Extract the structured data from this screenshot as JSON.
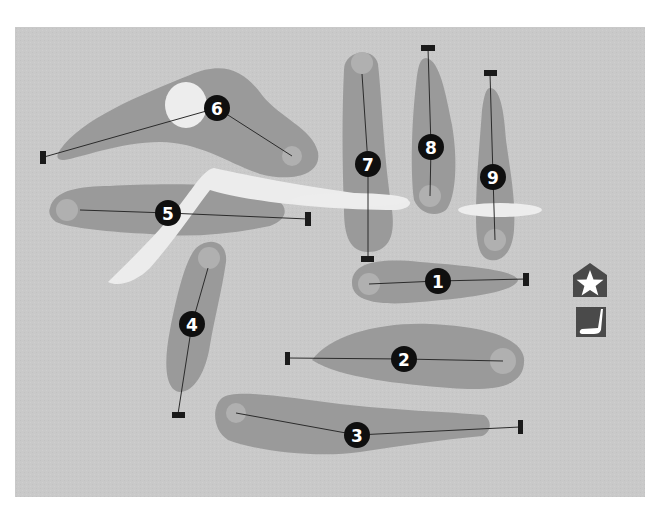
{
  "map": {
    "title": "Golf course layout",
    "frame": {
      "x": 15,
      "y": 27,
      "width": 630,
      "height": 470
    },
    "colors": {
      "background": "#ffffff",
      "rough": "#c9c9c9",
      "fairway": "#9a9a9a",
      "green": "#b0b0b0",
      "bunker": "#ededed",
      "path": "#ececec",
      "line": "#2b2b2b",
      "tee": "#1a1a1a",
      "marker": "#0f0f0f",
      "marker_text": "#ffffff",
      "icon_bg": "#4a4a4a",
      "icon_fg": "#ffffff"
    }
  },
  "holes": [
    {
      "number": "1",
      "label": "Hole 1",
      "fairway": "M352,283 C352,262 380,258 420,262 C470,266 515,270 518,280 C515,292 470,298 420,302 C380,306 352,302 352,283 Z",
      "green": {
        "cx": 369,
        "cy": 284,
        "r": 11
      },
      "tee": {
        "x": 523,
        "y": 273,
        "w": 6,
        "h": 13
      },
      "line": [
        [
          369,
          284
        ],
        [
          438,
          281
        ],
        [
          526,
          279
        ]
      ],
      "marker": {
        "cx": 438,
        "cy": 281
      }
    },
    {
      "number": "2",
      "label": "Hole 2",
      "fairway": "M312,360 C330,335 380,322 430,324 C480,326 520,336 524,358 C526,385 500,392 450,388 C400,384 340,378 312,360 Z",
      "green": {
        "cx": 503,
        "cy": 361,
        "r": 13
      },
      "tee": {
        "x": 285,
        "y": 352,
        "w": 5,
        "h": 13
      },
      "line": [
        [
          288,
          358
        ],
        [
          404,
          359
        ],
        [
          503,
          361
        ]
      ],
      "marker": {
        "cx": 404,
        "cy": 359
      }
    },
    {
      "number": "3",
      "label": "Hole 3",
      "fairway": "M222,398 C235,388 290,398 340,404 C390,410 450,412 484,415 C492,420 492,432 482,436 C440,440 400,446 360,452 C320,458 260,452 228,440 C212,430 212,406 222,398 Z",
      "green": {
        "cx": 236,
        "cy": 413,
        "r": 10
      },
      "tee": {
        "x": 518,
        "y": 420,
        "w": 5,
        "h": 14
      },
      "line": [
        [
          236,
          413
        ],
        [
          357,
          435
        ],
        [
          520,
          427
        ]
      ],
      "marker": {
        "cx": 357,
        "cy": 435
      }
    },
    {
      "number": "4",
      "label": "Hole 4",
      "fairway": "M196,248 C210,236 228,242 226,262 C222,290 214,320 210,345 C206,372 194,392 180,392 C164,390 164,360 170,330 C176,300 184,262 196,248 Z",
      "green": {
        "cx": 209,
        "cy": 258,
        "r": 11
      },
      "tee": {
        "x": 172,
        "y": 412,
        "w": 13,
        "h": 6
      },
      "line": [
        [
          208,
          268
        ],
        [
          192,
          324
        ],
        [
          178,
          414
        ]
      ],
      "marker": {
        "cx": 192,
        "cy": 324
      }
    },
    {
      "number": "5",
      "label": "Hole 5",
      "fairway": "M50,208 C54,190 80,186 110,186 C150,184 220,182 260,192 C290,200 292,218 270,226 C230,234 190,238 150,234 C110,232 70,228 56,222 C50,218 48,212 50,208 Z",
      "green": {
        "cx": 67,
        "cy": 210,
        "r": 11
      },
      "tee": {
        "x": 305,
        "y": 212,
        "w": 6,
        "h": 14
      },
      "line": [
        [
          80,
          210
        ],
        [
          168,
          213
        ],
        [
          308,
          219
        ]
      ],
      "marker": {
        "cx": 168,
        "cy": 213
      }
    },
    {
      "number": "6",
      "label": "Hole 6",
      "fairway": "M60,150 C80,120 140,95 190,75 C225,60 245,72 262,95 C280,118 312,128 318,152 C322,176 290,182 260,174 C230,164 200,142 160,142 C120,142 80,158 64,160 C56,160 56,156 60,150 Z",
      "green": {
        "cx": 292,
        "cy": 156,
        "r": 10
      },
      "bunker": {
        "cx": 186,
        "cy": 105,
        "rx": 21,
        "ry": 23
      },
      "tee": {
        "x": 40,
        "y": 151,
        "w": 6,
        "h": 13
      },
      "line": [
        [
          44,
          157
        ],
        [
          217,
          108
        ],
        [
          292,
          156
        ]
      ],
      "marker": {
        "cx": 217,
        "cy": 108
      }
    },
    {
      "number": "7",
      "label": "Hole 7",
      "fairway": "M344,70 C344,50 374,46 378,64 C382,100 384,160 392,210 C396,240 386,252 368,252 C350,252 344,236 344,210 C342,160 342,110 344,70 Z",
      "green": {
        "cx": 362,
        "cy": 63,
        "r": 11
      },
      "tee": {
        "x": 361,
        "y": 256,
        "w": 13,
        "h": 6
      },
      "line": [
        [
          362,
          74
        ],
        [
          368,
          164
        ],
        [
          368,
          259
        ]
      ],
      "marker": {
        "cx": 368,
        "cy": 164
      }
    },
    {
      "number": "8",
      "label": "Hole 8",
      "fairway": "M426,58 C440,60 446,95 452,125 C458,160 456,198 446,210 C436,218 420,214 414,200 C410,170 412,120 416,84 C418,66 420,58 426,58 Z",
      "green": {
        "cx": 430,
        "cy": 196,
        "r": 11
      },
      "tee": {
        "x": 421,
        "y": 45,
        "w": 14,
        "h": 6
      },
      "line": [
        [
          428,
          48
        ],
        [
          431,
          147
        ],
        [
          430,
          196
        ]
      ],
      "marker": {
        "cx": 431,
        "cy": 147
      }
    },
    {
      "number": "9",
      "label": "Hole 9",
      "fairway": "M490,88 C500,88 504,110 506,140 C510,170 516,200 514,230 C512,255 500,262 490,260 C478,258 476,240 476,215 C476,180 480,140 482,110 C484,96 486,88 490,88 Z",
      "green": {
        "cx": 495,
        "cy": 240,
        "r": 11
      },
      "tee": {
        "x": 484,
        "y": 70,
        "w": 13,
        "h": 6
      },
      "line": [
        [
          490,
          73
        ],
        [
          493,
          177
        ],
        [
          495,
          240
        ]
      ],
      "marker": {
        "cx": 493,
        "cy": 177
      }
    }
  ],
  "hazards": {
    "cart_path": "M108,282 C128,262 160,232 182,202 C196,184 204,170 214,168 C250,176 320,190 408,200 C414,204 406,210 396,210 C320,210 240,200 210,190 C196,208 176,238 150,268 C138,280 120,288 108,282 Z",
    "bunker_7": {
      "cx": 350,
      "cy": 200,
      "rx": 58,
      "ry": 7
    },
    "bunker_9": {
      "cx": 500,
      "cy": 210,
      "rx": 42,
      "ry": 7
    }
  },
  "legend": [
    {
      "name": "clubhouse",
      "icon": "star-house-icon",
      "x": 573,
      "y": 263,
      "w": 34,
      "h": 34
    },
    {
      "name": "putting-green",
      "icon": "putter-icon",
      "x": 576,
      "y": 307,
      "w": 30,
      "h": 30
    }
  ]
}
